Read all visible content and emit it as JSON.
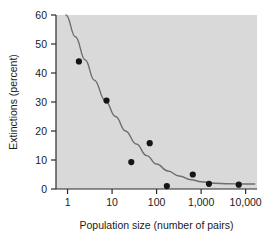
{
  "chart_data": {
    "type": "scatter",
    "title": "",
    "subtitle": "",
    "xlabel": "Population size (number of pairs)",
    "ylabel": "Extinctions (percent)",
    "xscale": "log",
    "yscale": "linear",
    "xlim": [
      0.55,
      18000
    ],
    "ylim": [
      0,
      60
    ],
    "xticks": [
      1,
      10,
      100,
      1000,
      10000
    ],
    "xtick_labels": [
      "1",
      "10",
      "100",
      "1,000",
      "10,000"
    ],
    "yticks": [
      0,
      10,
      20,
      30,
      40,
      50,
      60
    ],
    "ytick_labels": [
      "0",
      "10",
      "20",
      "30",
      "40",
      "50",
      "60"
    ],
    "grid": false,
    "legend": "none",
    "plot_background_color": "#d9d9d9",
    "figure_background_color": "#ffffff",
    "marker_color": "#151515",
    "curve_color": "#6e6e6e",
    "axis_color": "#2a2a2a",
    "series": [
      {
        "name": "Observed extinctions",
        "marker": "filled-circle",
        "points": [
          {
            "x": 1.8,
            "y": 44.0
          },
          {
            "x": 7.5,
            "y": 30.5
          },
          {
            "x": 27,
            "y": 9.3
          },
          {
            "x": 70,
            "y": 15.8
          },
          {
            "x": 170,
            "y": 1.0
          },
          {
            "x": 650,
            "y": 5.0
          },
          {
            "x": 1500,
            "y": 1.8
          },
          {
            "x": 7000,
            "y": 1.5
          }
        ]
      },
      {
        "name": "Fitted decline curve",
        "marker": "line",
        "points": [
          {
            "x": 0.92,
            "y": 60.0
          },
          {
            "x": 1.5,
            "y": 52.5
          },
          {
            "x": 2.5,
            "y": 44.5
          },
          {
            "x": 4.0,
            "y": 37.5
          },
          {
            "x": 7.0,
            "y": 30.5
          },
          {
            "x": 12,
            "y": 25.0
          },
          {
            "x": 20,
            "y": 20.0
          },
          {
            "x": 35,
            "y": 15.5
          },
          {
            "x": 60,
            "y": 11.5
          },
          {
            "x": 100,
            "y": 8.6
          },
          {
            "x": 180,
            "y": 6.2
          },
          {
            "x": 320,
            "y": 4.5
          },
          {
            "x": 600,
            "y": 3.2
          },
          {
            "x": 1000,
            "y": 2.5
          },
          {
            "x": 2000,
            "y": 2.0
          },
          {
            "x": 4000,
            "y": 1.8
          },
          {
            "x": 10000,
            "y": 1.7
          },
          {
            "x": 16000,
            "y": 1.7
          }
        ]
      }
    ]
  }
}
